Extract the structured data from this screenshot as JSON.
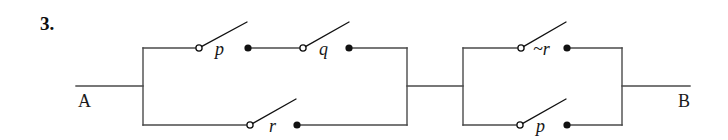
{
  "figure": {
    "problem_number": "3.",
    "type": "switching-circuit-diagram",
    "line_color": "#4a4a4a",
    "ink_color": "#111111",
    "background_color": "#ffffff"
  },
  "terminals": {
    "left": {
      "label": "A",
      "x": 76,
      "y": 86
    },
    "right": {
      "label": "B",
      "x": 690,
      "y": 86
    }
  },
  "blocks": [
    {
      "name": "block-1",
      "left_x": 143,
      "right_x": 407,
      "top_y": 48,
      "bottom_y": 125,
      "branches": [
        {
          "name": "branch-top",
          "rail": "top",
          "switches": [
            {
              "label": "p",
              "pivot_x": 199,
              "pivot_y": 48,
              "arm_end_x": 247,
              "arm_end_y": 22,
              "label_x": 215,
              "label_y": 40,
              "dot_x": 248,
              "dot_y": 48
            },
            {
              "label": "q",
              "pivot_x": 303,
              "pivot_y": 48,
              "arm_end_x": 349,
              "arm_end_y": 22,
              "label_x": 319,
              "label_y": 40,
              "dot_x": 349,
              "dot_y": 48
            }
          ]
        },
        {
          "name": "branch-bottom",
          "rail": "bottom",
          "switches": [
            {
              "label": "r",
              "pivot_x": 250,
              "pivot_y": 125,
              "arm_end_x": 296,
              "arm_end_y": 99,
              "label_x": 269,
              "label_y": 117,
              "dot_x": 297,
              "dot_y": 125
            }
          ]
        }
      ]
    },
    {
      "name": "block-2",
      "left_x": 463,
      "right_x": 622,
      "top_y": 48,
      "bottom_y": 125,
      "branches": [
        {
          "name": "branch-top",
          "rail": "top",
          "switches": [
            {
              "label": "~r",
              "pivot_x": 521,
              "pivot_y": 48,
              "arm_end_x": 566,
              "arm_end_y": 22,
              "label_x": 533,
              "label_y": 40,
              "dot_x": 567,
              "dot_y": 48
            }
          ]
        },
        {
          "name": "branch-bottom",
          "rail": "bottom",
          "switches": [
            {
              "label": "p",
              "pivot_x": 520,
              "pivot_y": 125,
              "arm_end_x": 566,
              "arm_end_y": 99,
              "label_x": 536,
              "label_y": 117,
              "dot_x": 567,
              "dot_y": 125
            }
          ]
        }
      ]
    }
  ],
  "connector": {
    "name": "inter-block-wire",
    "from_x": 407,
    "to_x": 463,
    "y": 86
  }
}
